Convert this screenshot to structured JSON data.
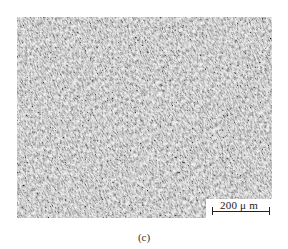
{
  "figure": {
    "panel_label": "(c)",
    "image_description": "Optical micrograph showing acicular/lath microstructure",
    "scale_bar": {
      "label": "200 μ m",
      "length_um": 200
    },
    "colors": {
      "background": "#ffffff",
      "micrograph_light": "#e6e6e6",
      "micrograph_dark": "#4a4a4a",
      "text": "#222222"
    }
  }
}
